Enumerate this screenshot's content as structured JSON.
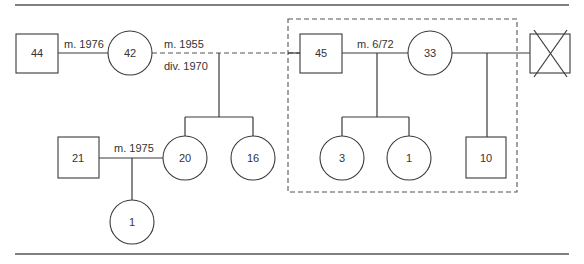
{
  "diagram": {
    "type": "genogram",
    "nodes": {
      "p44": {
        "label": "44",
        "sex": "male",
        "shape": "square"
      },
      "p42": {
        "label": "42",
        "sex": "female",
        "shape": "circle"
      },
      "p45": {
        "label": "45",
        "sex": "male",
        "shape": "square"
      },
      "p33": {
        "label": "33",
        "sex": "female",
        "shape": "circle"
      },
      "pX": {
        "label": "",
        "sex": "male",
        "shape": "square",
        "deceased": true
      },
      "p21": {
        "label": "21",
        "sex": "male",
        "shape": "square"
      },
      "p20": {
        "label": "20",
        "sex": "female",
        "shape": "circle"
      },
      "p16": {
        "label": "16",
        "sex": "female",
        "shape": "circle"
      },
      "p3": {
        "label": "3",
        "sex": "female",
        "shape": "circle"
      },
      "p1b": {
        "label": "1",
        "sex": "female",
        "shape": "circle"
      },
      "p10": {
        "label": "10",
        "sex": "male",
        "shape": "square"
      },
      "p1a": {
        "label": "1",
        "sex": "female",
        "shape": "circle"
      }
    },
    "relationships": {
      "r44_42": {
        "label": "m. 1976",
        "status": "married"
      },
      "r42_45": {
        "label": "m. 1955",
        "label2": "div. 1970",
        "status": "divorced"
      },
      "r45_33": {
        "label": "m. 6/72",
        "status": "married"
      },
      "r33_X": {
        "label": "",
        "status": "married"
      },
      "r21_20": {
        "label": "m. 1975",
        "status": "married"
      }
    },
    "household_boundary": {
      "members": [
        "45",
        "33",
        "3",
        "1",
        "10"
      ]
    }
  }
}
